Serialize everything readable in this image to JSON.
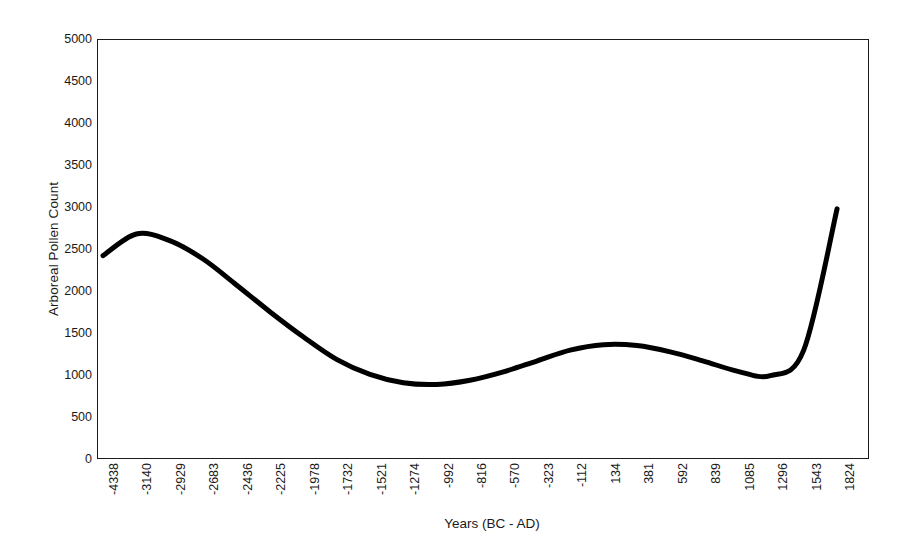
{
  "chart_data": {
    "type": "line",
    "title": "",
    "xlabel": "Years (BC - AD)",
    "ylabel": "Arboreal Pollen Count",
    "ylim": [
      0,
      5000
    ],
    "y_ticks": [
      0,
      500,
      1000,
      1500,
      2000,
      2500,
      3000,
      3500,
      4000,
      4500,
      5000
    ],
    "y_tick_labels": [
      "0",
      "500",
      "1000",
      "1500",
      "2000",
      "2500",
      "3000",
      "3500",
      "4000",
      "4500",
      "5000"
    ],
    "grid": false,
    "legend": "none",
    "line_color": "#000000",
    "line_width": 5,
    "categories": [
      "-4338",
      "-3140",
      "-2929",
      "-2683",
      "-2436",
      "-2225",
      "-1978",
      "-1732",
      "-1521",
      "-1274",
      "-992",
      "-816",
      "-570",
      "-323",
      "-112",
      "134",
      "381",
      "592",
      "839",
      "1085",
      "1296",
      "1543",
      "1824"
    ],
    "values": [
      2420,
      2680,
      2600,
      2380,
      2070,
      1750,
      1450,
      1180,
      1000,
      900,
      880,
      930,
      1030,
      1160,
      1290,
      1355,
      1345,
      1270,
      1160,
      1040,
      985,
      1290,
      2980
    ],
    "series": [
      {
        "name": "Arboreal Pollen Count",
        "values": [
          2420,
          2680,
          2600,
          2380,
          2070,
          1750,
          1450,
          1180,
          1000,
          900,
          880,
          930,
          1030,
          1160,
          1290,
          1355,
          1345,
          1270,
          1160,
          1040,
          985,
          1290,
          2980
        ]
      }
    ]
  },
  "axes": {
    "y_title": "Arboreal Pollen Count",
    "x_title": "Years (BC - AD)"
  },
  "style": {
    "background": "#ffffff",
    "border_color": "#1c1c1c",
    "text_color": "#1a1a1a"
  }
}
